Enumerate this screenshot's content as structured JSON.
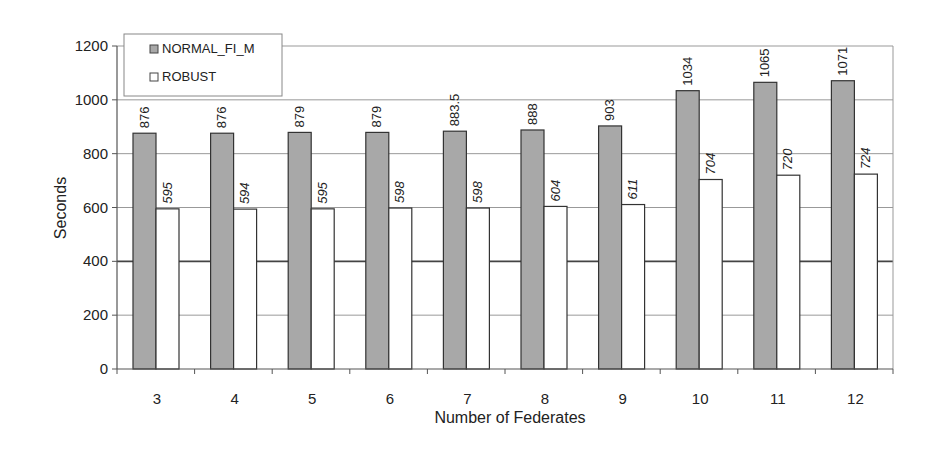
{
  "chart_data": {
    "type": "bar",
    "title": "",
    "xlabel": "Number of Federates",
    "ylabel": "Seconds",
    "ylim": [
      0,
      1200
    ],
    "yticks": [
      0,
      200,
      400,
      600,
      800,
      1000,
      1200
    ],
    "grid": true,
    "legend_position": "top-left",
    "categories": [
      "3",
      "4",
      "5",
      "6",
      "7",
      "8",
      "9",
      "10",
      "11",
      "12"
    ],
    "series": [
      {
        "name": "NORMAL_FI_M",
        "color": "#a8a8a8",
        "values": [
          876,
          876,
          879,
          879,
          883.5,
          888,
          903,
          1034,
          1065,
          1071
        ],
        "labels": [
          "876",
          "876",
          "879",
          "879",
          "883.5",
          "888",
          "903",
          "1034",
          "1065",
          "1071"
        ]
      },
      {
        "name": "ROBUST",
        "color": "#ffffff",
        "values": [
          595,
          594,
          595,
          598,
          598,
          604,
          611,
          704,
          720,
          724
        ],
        "labels": [
          "595",
          "594",
          "595",
          "598",
          "598",
          "604",
          "611",
          "704",
          "720",
          "724"
        ]
      }
    ]
  },
  "legend": {
    "items": [
      {
        "label": "NORMAL_FI_M",
        "color": "#a8a8a8"
      },
      {
        "label": "ROBUST",
        "color": "#ffffff"
      }
    ]
  },
  "axes": {
    "x_title": "Number of Federates",
    "y_title": "Seconds"
  }
}
